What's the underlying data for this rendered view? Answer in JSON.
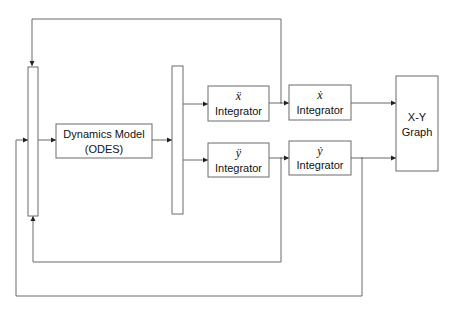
{
  "diagram": {
    "type": "block-diagram",
    "blocks": {
      "dynamics": {
        "line1": "Dynamics Model",
        "line2": "(ODES)"
      },
      "xddot_integrator": {
        "symbol": "ẍ",
        "label": "Integrator"
      },
      "xdot_integrator": {
        "symbol": "ẋ",
        "label": "Integrator"
      },
      "yddot_integrator": {
        "symbol": "ÿ",
        "label": "Integrator"
      },
      "ydot_integrator": {
        "symbol": "ẏ",
        "label": "Integrator"
      },
      "xy_graph": {
        "line1": "X-Y",
        "line2": "Graph"
      }
    },
    "connections": [
      {
        "from": "mux",
        "to": "dynamics"
      },
      {
        "from": "dynamics",
        "to": "demux"
      },
      {
        "from": "demux",
        "to": "xddot_integrator"
      },
      {
        "from": "demux",
        "to": "yddot_integrator"
      },
      {
        "from": "xddot_integrator",
        "to": "xdot_integrator"
      },
      {
        "from": "yddot_integrator",
        "to": "ydot_integrator"
      },
      {
        "from": "xdot_integrator",
        "to": "xy_graph"
      },
      {
        "from": "ydot_integrator",
        "to": "xy_graph"
      },
      {
        "from": "xddot_integrator",
        "to": "mux",
        "kind": "feedback"
      },
      {
        "from": "yddot_integrator",
        "to": "mux",
        "kind": "feedback"
      },
      {
        "from": "ydot_integrator",
        "to": "mux",
        "kind": "feedback"
      }
    ],
    "colors": {
      "line": "#6b6b6b",
      "text": "#111111",
      "background": "#ffffff"
    }
  }
}
